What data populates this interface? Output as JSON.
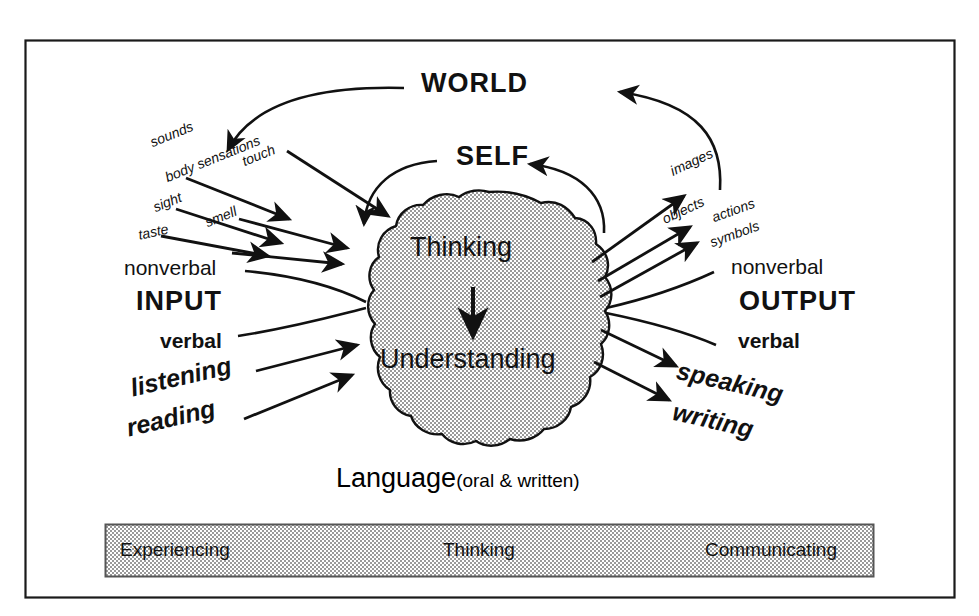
{
  "diagram": {
    "frame": {
      "border_color": "#1a1a1a"
    },
    "top_cycles": [
      {
        "name": "world-cycle",
        "label": "WORLD"
      },
      {
        "name": "self-cycle",
        "label": "SELF"
      }
    ],
    "center": {
      "shape": "brain-blob",
      "fill_color": "#d6d6d6",
      "top_label": "Thinking",
      "bottom_label": "Understanding",
      "inner_arrow": "down-arrow"
    },
    "input_side": {
      "heading": "INPUT",
      "nonverbal_label": "nonverbal",
      "verbal_label": "verbal",
      "sense_labels": [
        "sounds",
        "touch",
        "body sensations",
        "sight",
        "smell",
        "taste"
      ],
      "verbal_modes": [
        "listening",
        "reading"
      ]
    },
    "output_side": {
      "heading": "OUTPUT",
      "nonverbal_label": "nonverbal",
      "verbal_label": "verbal",
      "product_labels": [
        "images",
        "objects",
        "actions",
        "symbols"
      ],
      "verbal_modes": [
        "speaking",
        "writing"
      ]
    },
    "language_caption": {
      "main": "Language",
      "paren": "(oral & written)"
    },
    "bottom_bar": {
      "fill_color": "#d6d6d6",
      "border_color": "#555555",
      "cells": [
        "Experiencing",
        "Thinking",
        "Communicating"
      ]
    }
  }
}
